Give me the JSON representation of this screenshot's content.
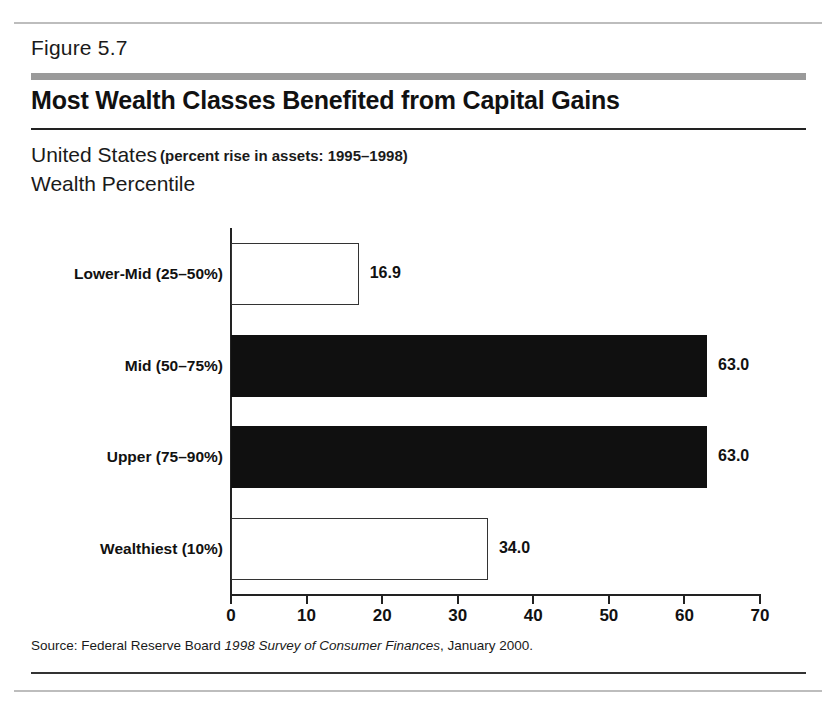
{
  "figure": {
    "number_label": "Figure 5.7",
    "title": "Most Wealth Classes Benefited from Capital Gains",
    "subtitle_main": "United States",
    "subtitle_paren": "(percent rise in assets: 1995–1998)",
    "axis_heading": "Wealth Percentile",
    "source_prefix": "Source: Federal Reserve Board ",
    "source_italic": "1998 Survey of Consumer Finances",
    "source_suffix": ", January 2000."
  },
  "colors": {
    "bar_filled": "#101010",
    "bar_open": "#ffffff",
    "bar_outline": "#333333",
    "gray_band": "#9a9a9a",
    "rule": "#222222",
    "page_rule": "#bdbdbd"
  },
  "chart_data": {
    "type": "bar",
    "orientation": "horizontal",
    "title": "Most Wealth Classes Benefited from Capital Gains",
    "subtitle": "United States (percent rise in assets: 1995–1998)",
    "xlabel": "",
    "ylabel": "Wealth Percentile",
    "xlim": [
      0,
      70
    ],
    "grid": false,
    "legend": "none",
    "xticks": [
      0,
      10,
      20,
      30,
      40,
      50,
      60,
      70
    ],
    "xtick_labels": [
      "0",
      "10",
      "20",
      "30",
      "40",
      "50",
      "60",
      "70"
    ],
    "categories": [
      "Lower-Mid (25–50%)",
      "Mid (50–75%)",
      "Upper (75–90%)",
      "Wealthiest (10%)"
    ],
    "values": [
      16.9,
      63.0,
      63.0,
      34.0
    ],
    "value_labels": [
      "16.9",
      "63.0",
      "63.0",
      "34.0"
    ],
    "bar_styles": [
      "open",
      "filled",
      "filled",
      "open"
    ]
  }
}
